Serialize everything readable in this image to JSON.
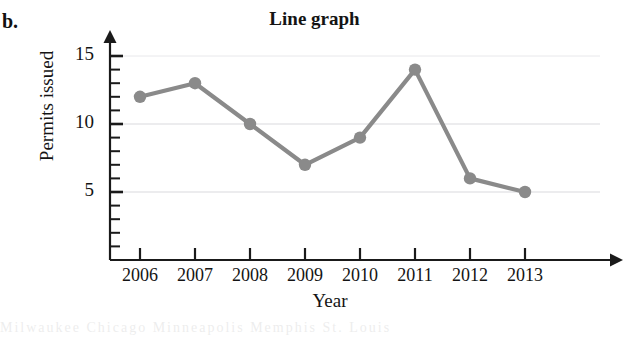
{
  "figure": {
    "part_label": "b.",
    "bleed_text": "Milwaukee Chicago Minneapolis Memphis St. Louis"
  },
  "chart_data": {
    "type": "line",
    "title": "Line graph",
    "xlabel": "Year",
    "ylabel": "Permits issued",
    "categories": [
      "2006",
      "2007",
      "2008",
      "2009",
      "2010",
      "2011",
      "2012",
      "2013"
    ],
    "values": [
      12,
      13,
      10,
      7,
      9,
      14,
      6,
      5
    ],
    "series": [
      {
        "name": "Permits issued",
        "values": [
          12,
          13,
          10,
          7,
          9,
          14,
          6,
          5
        ]
      }
    ],
    "ylim": [
      0,
      15
    ],
    "y_tick_labels": [
      "5",
      "10",
      "15"
    ],
    "y_tick_values": [
      5,
      10,
      15
    ],
    "y_minor_tick_step": 1,
    "grid": true,
    "grid_axis": "y",
    "legend": "none",
    "axis_arrows": true,
    "line_color": "#8a8a8a",
    "marker_color": "#8a8a8a",
    "axis_color": "#1a1a1a",
    "grid_color": "#d8d8dc"
  }
}
